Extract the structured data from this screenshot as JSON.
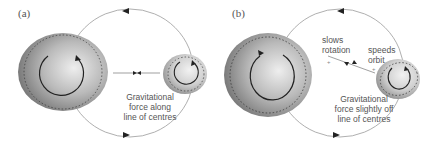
{
  "panels": [
    {
      "id": "a",
      "label": "(a)",
      "caption_lines": [
        "Gravitational",
        "force along",
        "line of centres"
      ]
    },
    {
      "id": "b",
      "label": "(b)",
      "caption_lines": [
        "Gravitational",
        "force slightly off",
        "line of centres"
      ],
      "annotations": {
        "slows_rotation": [
          "slows",
          "rotation"
        ],
        "speeds_orbit": [
          "speeds",
          "orbit"
        ]
      }
    }
  ],
  "colors": {
    "orbit": "#9a9a9a",
    "arrow": "#222222",
    "body_dark": "#6e6e6e",
    "body_light": "#e6e6e6",
    "text": "#555555"
  }
}
